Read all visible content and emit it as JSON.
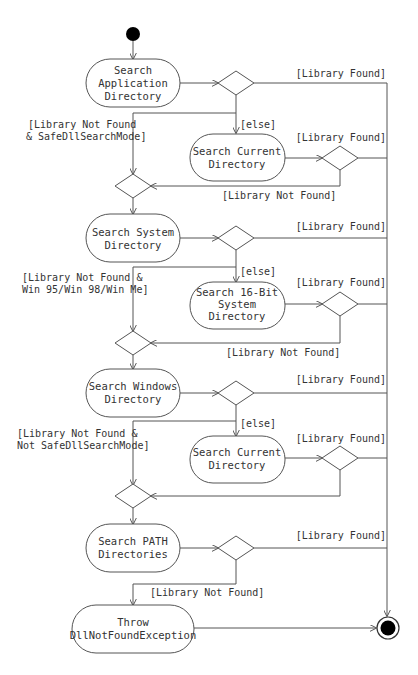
{
  "diagram": {
    "type": "uml-activity",
    "activities": {
      "a1": [
        "Search",
        "Application",
        "Directory"
      ],
      "a2": [
        "Search Current",
        "Directory"
      ],
      "a3": [
        "Search System",
        "Directory"
      ],
      "a4": [
        "Search 16-Bit",
        "System",
        "Directory"
      ],
      "a5": [
        "Search Windows",
        "Directory"
      ],
      "a6": [
        "Search Current",
        "Directory"
      ],
      "a7": [
        "Search PATH",
        "Directories"
      ],
      "a8": [
        "Throw",
        "DllNotFoundException"
      ]
    },
    "guards": {
      "found": "[Library Found]",
      "not_found": "[Library Not Found]",
      "else": "[else]",
      "safe_mode": [
        "[Library Not Found",
        "& SafeDllSearchMode]"
      ],
      "win9x": [
        "[Library Not Found &",
        "Win 95/Win 98/Win Me]"
      ],
      "not_safe_mode": [
        "[Library Not Found &",
        "Not SafeDllSearchMode]"
      ]
    }
  }
}
